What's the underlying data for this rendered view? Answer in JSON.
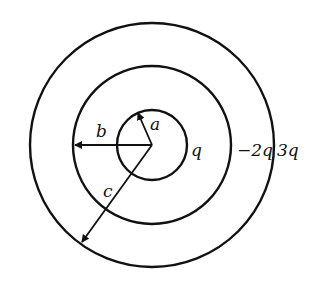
{
  "diagram": {
    "center": {
      "x": 152,
      "y": 145
    },
    "circles": [
      {
        "name": "inner",
        "radius": 35,
        "charge_label": "q"
      },
      {
        "name": "middle",
        "radius": 79,
        "charge_label": "−2q"
      },
      {
        "name": "outer",
        "radius": 122,
        "charge_label": "3q"
      }
    ],
    "radii_labels": {
      "a": "a",
      "b": "b",
      "c": "c"
    },
    "stroke_color": "#111111",
    "background": "#ffffff"
  }
}
